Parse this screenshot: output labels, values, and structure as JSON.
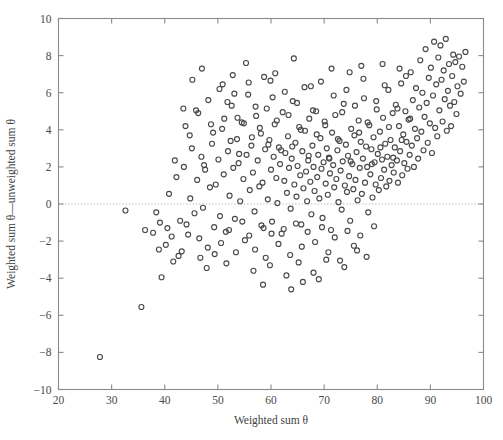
{
  "figure": {
    "background_color": "#ffffff",
    "axis_color": "#8a8a8a",
    "marker_color": "#4a4a4a",
    "zero_line_color": "#9a9a9a"
  },
  "chart_data": {
    "type": "scatter",
    "title": "",
    "xlabel": "Weighted sum θ",
    "ylabel": "Weighted sum θ—unweighted sum θ",
    "xlim": [
      20,
      100
    ],
    "ylim": [
      -10,
      10
    ],
    "xticks": [
      20,
      30,
      40,
      50,
      60,
      70,
      80,
      90,
      100
    ],
    "yticks": [
      -10,
      -8,
      -6,
      -4,
      -2,
      0,
      2,
      4,
      6,
      8,
      10
    ],
    "xticklabels": [
      "20",
      "30",
      "40",
      "50",
      "60",
      "70",
      "80",
      "90",
      "100"
    ],
    "yticklabels": [
      "−10",
      "−8",
      "−6",
      "−4",
      "−2",
      "0",
      "2",
      "4",
      "6",
      "8",
      "10"
    ],
    "grid": false,
    "legend": null,
    "annotations": [
      {
        "type": "hline",
        "y": 0,
        "style": "dotted",
        "label": "zero reference line"
      }
    ],
    "marker_style": {
      "shape": "circle",
      "filled": false,
      "size_px": 5
    },
    "n_points": 372,
    "points": [
      [
        27.8,
        -8.25
      ],
      [
        35.6,
        -5.55
      ],
      [
        39.4,
        -3.95
      ],
      [
        41.6,
        -3.1
      ],
      [
        43.2,
        -2.55
      ],
      [
        32.6,
        -0.35
      ],
      [
        36.3,
        -1.4
      ],
      [
        37.8,
        -1.55
      ],
      [
        38.4,
        -0.45
      ],
      [
        39.1,
        -1.0
      ],
      [
        40.2,
        -2.2
      ],
      [
        40.8,
        0.55
      ],
      [
        41.3,
        -1.75
      ],
      [
        42.2,
        1.45
      ],
      [
        42.9,
        -0.9
      ],
      [
        43.6,
        2.0
      ],
      [
        44.1,
        -1.1
      ],
      [
        44.8,
        0.3
      ],
      [
        45.2,
        6.7
      ],
      [
        45.6,
        -0.5
      ],
      [
        46.1,
        1.3
      ],
      [
        46.5,
        -1.85
      ],
      [
        46.9,
        2.55
      ],
      [
        47.2,
        -0.2
      ],
      [
        47.6,
        1.85
      ],
      [
        48.1,
        -2.35
      ],
      [
        48.5,
        0.9
      ],
      [
        48.9,
        3.25
      ],
      [
        49.3,
        -1.25
      ],
      [
        49.6,
        1.05
      ],
      [
        50.1,
        2.4
      ],
      [
        50.4,
        -0.65
      ],
      [
        50.8,
        4.05
      ],
      [
        51.1,
        1.6
      ],
      [
        51.5,
        -1.5
      ],
      [
        51.9,
        2.85
      ],
      [
        52.2,
        0.45
      ],
      [
        52.6,
        5.3
      ],
      [
        52.9,
        1.95
      ],
      [
        53.2,
        -0.8
      ],
      [
        53.6,
        3.5
      ],
      [
        53.9,
        2.2
      ],
      [
        54.2,
        0.15
      ],
      [
        54.5,
        4.4
      ],
      [
        54.8,
        1.35
      ],
      [
        55.1,
        -1.95
      ],
      [
        55.4,
        2.65
      ],
      [
        55.7,
        5.9
      ],
      [
        56.0,
        0.75
      ],
      [
        56.3,
        3.15
      ],
      [
        56.6,
        1.7
      ],
      [
        56.9,
        -0.4
      ],
      [
        57.2,
        4.75
      ],
      [
        57.5,
        2.35
      ],
      [
        57.8,
        0.95
      ],
      [
        58.1,
        3.8
      ],
      [
        58.4,
        1.15
      ],
      [
        58.6,
        -1.3
      ],
      [
        58.9,
        2.95
      ],
      [
        59.2,
        5.15
      ],
      [
        59.4,
        0.25
      ],
      [
        59.7,
        3.45
      ],
      [
        60.0,
        1.85
      ],
      [
        60.2,
        -0.95
      ],
      [
        60.5,
        2.55
      ],
      [
        60.7,
        4.3
      ],
      [
        61.0,
        1.4
      ],
      [
        61.2,
        0.05
      ],
      [
        61.5,
        3.05
      ],
      [
        61.7,
        2.15
      ],
      [
        62.0,
        -1.6
      ],
      [
        62.2,
        4.95
      ],
      [
        62.5,
        1.25
      ],
      [
        62.7,
        2.75
      ],
      [
        63.0,
        0.6
      ],
      [
        63.2,
        3.65
      ],
      [
        63.4,
        1.95
      ],
      [
        63.7,
        -0.25
      ],
      [
        63.9,
        2.45
      ],
      [
        64.1,
        5.55
      ],
      [
        64.4,
        1.05
      ],
      [
        64.6,
        3.3
      ],
      [
        64.8,
        0.4
      ],
      [
        65.0,
        2.05
      ],
      [
        65.3,
        4.15
      ],
      [
        65.5,
        1.55
      ],
      [
        65.7,
        -1.1
      ],
      [
        65.9,
        2.85
      ],
      [
        66.1,
        0.85
      ],
      [
        66.4,
        3.95
      ],
      [
        66.6,
        1.75
      ],
      [
        66.8,
        0.15
      ],
      [
        67.0,
        2.35
      ],
      [
        67.2,
        4.6
      ],
      [
        67.4,
        1.2
      ],
      [
        67.6,
        -0.55
      ],
      [
        67.8,
        3.15
      ],
      [
        68.0,
        2.0
      ],
      [
        68.2,
        0.7
      ],
      [
        68.5,
        5.0
      ],
      [
        68.7,
        1.45
      ],
      [
        68.9,
        2.65
      ],
      [
        69.1,
        0.3
      ],
      [
        69.3,
        3.55
      ],
      [
        69.5,
        1.9
      ],
      [
        69.7,
        -0.75
      ],
      [
        69.9,
        2.25
      ],
      [
        70.1,
        4.45
      ],
      [
        70.3,
        1.1
      ],
      [
        70.5,
        3.0
      ],
      [
        70.7,
        0.5
      ],
      [
        70.9,
        2.5
      ],
      [
        71.1,
        1.65
      ],
      [
        71.3,
        -1.4
      ],
      [
        71.5,
        3.85
      ],
      [
        71.7,
        2.1
      ],
      [
        71.9,
        0.9
      ],
      [
        72.1,
        4.8
      ],
      [
        72.3,
        1.35
      ],
      [
        72.5,
        2.9
      ],
      [
        72.7,
        0.1
      ],
      [
        72.9,
        3.4
      ],
      [
        73.1,
        1.8
      ],
      [
        73.3,
        -0.3
      ],
      [
        73.5,
        2.3
      ],
      [
        73.7,
        5.4
      ],
      [
        73.9,
        1.0
      ],
      [
        74.1,
        3.2
      ],
      [
        74.3,
        0.65
      ],
      [
        74.5,
        2.6
      ],
      [
        74.7,
        1.5
      ],
      [
        74.9,
        -0.9
      ],
      [
        75.1,
        4.05
      ],
      [
        75.3,
        2.15
      ],
      [
        75.5,
        0.8
      ],
      [
        75.7,
        3.7
      ],
      [
        75.9,
        1.3
      ],
      [
        76.1,
        2.8
      ],
      [
        76.3,
        0.2
      ],
      [
        76.5,
        4.5
      ],
      [
        76.7,
        1.95
      ],
      [
        76.9,
        3.35
      ],
      [
        77.1,
        0.55
      ],
      [
        77.3,
        2.45
      ],
      [
        77.5,
        5.7
      ],
      [
        77.7,
        1.15
      ],
      [
        77.9,
        3.1
      ],
      [
        78.1,
        2.0
      ],
      [
        78.3,
        -0.45
      ],
      [
        78.5,
        4.25
      ],
      [
        78.7,
        1.6
      ],
      [
        78.9,
        2.95
      ],
      [
        79.1,
        0.35
      ],
      [
        79.3,
        3.6
      ],
      [
        79.5,
        2.25
      ],
      [
        79.7,
        1.05
      ],
      [
        79.9,
        5.1
      ],
      [
        80.1,
        2.7
      ],
      [
        80.3,
        0.75
      ],
      [
        80.5,
        3.9
      ],
      [
        80.7,
        1.4
      ],
      [
        80.9,
        2.4
      ],
      [
        81.1,
        4.65
      ],
      [
        81.3,
        1.85
      ],
      [
        81.5,
        3.25
      ],
      [
        81.7,
        0.95
      ],
      [
        81.9,
        2.55
      ],
      [
        82.1,
        6.15
      ],
      [
        82.3,
        1.25
      ],
      [
        82.5,
        3.45
      ],
      [
        82.7,
        2.1
      ],
      [
        82.9,
        4.9
      ],
      [
        83.1,
        1.7
      ],
      [
        83.3,
        3.05
      ],
      [
        83.5,
        5.35
      ],
      [
        83.7,
        2.35
      ],
      [
        83.9,
        1.15
      ],
      [
        84.1,
        4.2
      ],
      [
        84.3,
        2.85
      ],
      [
        84.5,
        6.5
      ],
      [
        84.7,
        1.55
      ],
      [
        84.9,
        3.75
      ],
      [
        85.1,
        2.2
      ],
      [
        85.3,
        5.0
      ],
      [
        85.5,
        3.35
      ],
      [
        85.7,
        1.9
      ],
      [
        85.9,
        4.55
      ],
      [
        86.1,
        2.65
      ],
      [
        86.3,
        7.1
      ],
      [
        86.5,
        3.15
      ],
      [
        86.7,
        5.6
      ],
      [
        86.9,
        2.0
      ],
      [
        87.1,
        4.05
      ],
      [
        87.3,
        6.25
      ],
      [
        87.5,
        3.55
      ],
      [
        87.7,
        2.45
      ],
      [
        87.9,
        5.2
      ],
      [
        88.1,
        7.75
      ],
      [
        88.3,
        3.9
      ],
      [
        88.5,
        6.0
      ],
      [
        88.7,
        2.9
      ],
      [
        88.9,
        4.7
      ],
      [
        89.1,
        8.35
      ],
      [
        89.3,
        5.45
      ],
      [
        89.5,
        3.3
      ],
      [
        89.7,
        6.8
      ],
      [
        89.9,
        4.35
      ],
      [
        90.1,
        7.35
      ],
      [
        90.3,
        2.75
      ],
      [
        90.5,
        5.85
      ],
      [
        90.7,
        8.75
      ],
      [
        90.9,
        4.1
      ],
      [
        91.1,
        6.45
      ],
      [
        91.3,
        3.65
      ],
      [
        91.5,
        7.9
      ],
      [
        91.7,
        5.05
      ],
      [
        91.9,
        8.55
      ],
      [
        92.1,
        6.7
      ],
      [
        92.3,
        4.45
      ],
      [
        92.5,
        7.2
      ],
      [
        92.7,
        5.65
      ],
      [
        92.9,
        8.9
      ],
      [
        93.1,
        3.95
      ],
      [
        93.3,
        6.1
      ],
      [
        93.5,
        7.55
      ],
      [
        93.7,
        5.3
      ],
      [
        93.9,
        4.2
      ],
      [
        94.1,
        6.9
      ],
      [
        94.3,
        8.05
      ],
      [
        94.5,
        5.5
      ],
      [
        94.7,
        7.65
      ],
      [
        94.9,
        4.85
      ],
      [
        95.1,
        6.35
      ],
      [
        95.4,
        7.95
      ],
      [
        95.7,
        5.95
      ],
      [
        96.0,
        7.4
      ],
      [
        96.3,
        6.6
      ],
      [
        96.6,
        8.2
      ],
      [
        43.9,
        4.2
      ],
      [
        45.1,
        3.0
      ],
      [
        46.3,
        4.9
      ],
      [
        47.4,
        2.1
      ],
      [
        48.2,
        5.6
      ],
      [
        49.1,
        3.85
      ],
      [
        50.3,
        6.2
      ],
      [
        51.2,
        4.6
      ],
      [
        52.4,
        3.4
      ],
      [
        53.1,
        5.95
      ],
      [
        54.0,
        2.7
      ],
      [
        54.9,
        4.35
      ],
      [
        55.8,
        6.55
      ],
      [
        56.4,
        3.6
      ],
      [
        57.1,
        5.25
      ],
      [
        57.9,
        4.1
      ],
      [
        58.7,
        6.85
      ],
      [
        59.5,
        3.2
      ],
      [
        60.3,
        5.75
      ],
      [
        61.1,
        4.5
      ],
      [
        61.9,
        2.9
      ],
      [
        62.6,
        6.05
      ],
      [
        63.3,
        4.8
      ],
      [
        64.0,
        3.1
      ],
      [
        64.9,
        5.45
      ],
      [
        65.6,
        4.0
      ],
      [
        66.3,
        6.3
      ],
      [
        67.1,
        2.6
      ],
      [
        67.9,
        5.05
      ],
      [
        68.6,
        3.75
      ],
      [
        69.4,
        6.6
      ],
      [
        70.2,
        4.25
      ],
      [
        71.0,
        2.45
      ],
      [
        71.8,
        5.85
      ],
      [
        72.6,
        3.5
      ],
      [
        73.4,
        4.95
      ],
      [
        74.2,
        6.15
      ],
      [
        75.0,
        2.3
      ],
      [
        75.8,
        5.3
      ],
      [
        76.6,
        3.85
      ],
      [
        77.4,
        6.75
      ],
      [
        78.2,
        4.4
      ],
      [
        79.0,
        2.15
      ],
      [
        79.8,
        5.55
      ],
      [
        80.6,
        3.05
      ],
      [
        81.4,
        6.4
      ],
      [
        82.2,
        4.15
      ],
      [
        83.0,
        2.5
      ],
      [
        83.8,
        5.15
      ],
      [
        84.6,
        3.45
      ],
      [
        85.4,
        6.9
      ],
      [
        86.2,
        4.6
      ],
      [
        50.6,
        -2.1
      ],
      [
        52.1,
        -1.4
      ],
      [
        53.4,
        -2.6
      ],
      [
        54.6,
        -0.95
      ],
      [
        55.9,
        -1.7
      ],
      [
        57.0,
        -2.45
      ],
      [
        58.2,
        -1.15
      ],
      [
        59.0,
        -2.9
      ],
      [
        60.1,
        -1.6
      ],
      [
        61.4,
        -2.15
      ],
      [
        62.4,
        -1.35
      ],
      [
        63.6,
        -2.75
      ],
      [
        64.7,
        -1.05
      ],
      [
        65.8,
        -2.3
      ],
      [
        66.9,
        -1.5
      ],
      [
        68.3,
        -2.05
      ],
      [
        69.6,
        -1.25
      ],
      [
        70.8,
        -2.6
      ],
      [
        72.0,
        -1.8
      ],
      [
        73.0,
        -3.05
      ],
      [
        74.4,
        -1.45
      ],
      [
        75.6,
        -2.25
      ],
      [
        76.8,
        -1.7
      ],
      [
        78.0,
        -2.85
      ],
      [
        79.4,
        -1.2
      ],
      [
        46.7,
        -2.9
      ],
      [
        47.9,
        -3.45
      ],
      [
        49.4,
        -2.7
      ],
      [
        51.6,
        -3.2
      ],
      [
        44.4,
        -1.65
      ],
      [
        42.6,
        -2.8
      ],
      [
        40.5,
        -1.3
      ],
      [
        38.9,
        -2.45
      ],
      [
        56.7,
        -3.6
      ],
      [
        59.8,
        -3.3
      ],
      [
        62.9,
        -3.85
      ],
      [
        65.2,
        -3.15
      ],
      [
        68.0,
        -3.7
      ],
      [
        70.4,
        -3.0
      ],
      [
        73.8,
        -3.4
      ],
      [
        76.2,
        -2.5
      ],
      [
        66.0,
        -4.2
      ],
      [
        69.0,
        -4.05
      ],
      [
        58.5,
        -4.35
      ],
      [
        63.8,
        -4.6
      ],
      [
        47.0,
        7.3
      ],
      [
        50.9,
        6.45
      ],
      [
        55.3,
        7.6
      ],
      [
        60.8,
        7.05
      ],
      [
        64.3,
        7.85
      ],
      [
        45.9,
        5.05
      ],
      [
        44.7,
        3.7
      ],
      [
        43.5,
        5.15
      ],
      [
        41.9,
        2.35
      ],
      [
        52.8,
        6.95
      ],
      [
        71.4,
        7.3
      ],
      [
        74.8,
        7.1
      ],
      [
        77.0,
        7.45
      ],
      [
        81.0,
        7.55
      ],
      [
        84.2,
        7.3
      ],
      [
        67.5,
        6.35
      ],
      [
        59.9,
        6.65
      ],
      [
        53.7,
        4.65
      ],
      [
        48.7,
        4.3
      ],
      [
        51.8,
        5.5
      ]
    ]
  }
}
